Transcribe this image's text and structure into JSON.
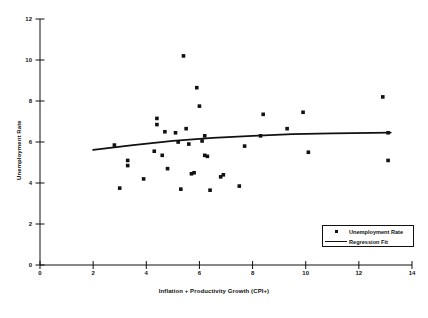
{
  "chart_data": {
    "type": "scatter",
    "title": "",
    "xlabel": "Inflation + Productivity Growth (CPI+)",
    "ylabel": "Unemployment Rate",
    "xlim": [
      0,
      14
    ],
    "ylim": [
      0,
      12
    ],
    "xticks": [
      0,
      2,
      4,
      6,
      8,
      10,
      12,
      14
    ],
    "yticks": [
      0,
      2,
      4,
      6,
      8,
      10,
      12
    ],
    "grid": false,
    "legend_position": "lower-right",
    "series": [
      {
        "name": "Unemployment Rate",
        "type": "scatter",
        "marker": "square",
        "color": "#111111",
        "points": [
          [
            2.8,
            5.85
          ],
          [
            3.0,
            3.75
          ],
          [
            3.3,
            5.1
          ],
          [
            3.3,
            4.85
          ],
          [
            3.9,
            4.2
          ],
          [
            4.3,
            5.55
          ],
          [
            4.4,
            7.15
          ],
          [
            4.4,
            6.85
          ],
          [
            4.6,
            5.35
          ],
          [
            4.7,
            6.5
          ],
          [
            4.8,
            4.7
          ],
          [
            5.1,
            6.45
          ],
          [
            5.2,
            6.0
          ],
          [
            5.3,
            3.7
          ],
          [
            5.4,
            10.2
          ],
          [
            5.5,
            6.65
          ],
          [
            5.6,
            5.9
          ],
          [
            5.7,
            4.45
          ],
          [
            5.8,
            4.5
          ],
          [
            5.9,
            8.65
          ],
          [
            6.0,
            7.75
          ],
          [
            6.1,
            6.05
          ],
          [
            6.2,
            6.3
          ],
          [
            6.2,
            5.35
          ],
          [
            6.3,
            5.3
          ],
          [
            6.4,
            3.65
          ],
          [
            6.8,
            4.3
          ],
          [
            6.9,
            4.4
          ],
          [
            7.5,
            3.85
          ],
          [
            7.7,
            5.8
          ],
          [
            8.3,
            6.3
          ],
          [
            8.4,
            7.35
          ],
          [
            9.3,
            6.65
          ],
          [
            9.9,
            7.45
          ],
          [
            10.1,
            5.5
          ],
          [
            12.9,
            8.2
          ],
          [
            13.1,
            6.45
          ],
          [
            13.1,
            5.1
          ]
        ]
      },
      {
        "name": "Regression Fit",
        "type": "line",
        "color": "#111111",
        "points": [
          [
            2.0,
            5.62
          ],
          [
            3.5,
            5.85
          ],
          [
            5.0,
            6.05
          ],
          [
            6.5,
            6.2
          ],
          [
            8.0,
            6.3
          ],
          [
            9.5,
            6.38
          ],
          [
            11.0,
            6.42
          ],
          [
            12.5,
            6.45
          ],
          [
            13.2,
            6.46
          ]
        ]
      }
    ]
  },
  "legend": {
    "items": [
      {
        "label": "Unemployment Rate",
        "symbol": "square-marker"
      },
      {
        "label": "Regression Fit",
        "symbol": "line-segment"
      }
    ]
  }
}
